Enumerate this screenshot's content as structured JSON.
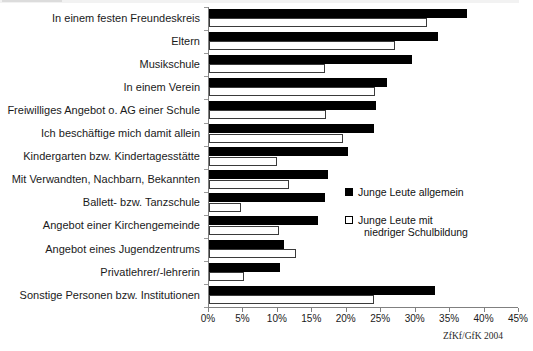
{
  "chart_data": {
    "type": "bar",
    "orientation": "horizontal",
    "title": "",
    "xlabel": "",
    "ylabel": "",
    "xlim": [
      0,
      45
    ],
    "xticks": [
      "0%",
      "5%",
      "10%",
      "15%",
      "20%",
      "25%",
      "30%",
      "35%",
      "40%",
      "45%"
    ],
    "xtick_values": [
      0,
      5,
      10,
      15,
      20,
      25,
      30,
      35,
      40,
      45
    ],
    "grid": false,
    "legend_position": "middle-right",
    "categories": [
      "In einem festen Freundeskreis",
      "Eltern",
      "Musikschule",
      "In einem Verein",
      "Freiwilliges Angebot o. AG einer Schule",
      "Ich beschäftige mich damit allein",
      "Kindergarten bzw. Kindertagesstätte",
      "Mit Verwandten, Nachbarn, Bekannten",
      "Ballett- bzw. Tanzschule",
      "Angebot einer Kirchengemeinde",
      "Angebot eines Jugendzentrums",
      "Privatlehrer/-lehrerin",
      "Sonstige Personen bzw. Institutionen"
    ],
    "series": [
      {
        "name": "Junge Leute allgemein",
        "color": "#000000",
        "values": [
          37.5,
          33.3,
          29.4,
          25.8,
          24.3,
          24.0,
          20.2,
          17.3,
          16.8,
          15.8,
          10.9,
          10.3,
          32.8
        ]
      },
      {
        "name": "Junge Leute mit niedriger Schulbildung",
        "color": "#ffffff",
        "values": [
          31.7,
          27.0,
          16.8,
          24.1,
          17.0,
          19.5,
          9.9,
          11.6,
          4.6,
          10.2,
          12.6,
          5.1,
          24.0
        ]
      }
    ]
  },
  "legend": {
    "items": [
      {
        "label": "Junge Leute allgemein",
        "label_line2": ""
      },
      {
        "label": "Junge Leute mit",
        "label_line2": "niedriger Schulbildung"
      }
    ]
  },
  "source": {
    "text": "ZfKf/GfK 2004"
  }
}
